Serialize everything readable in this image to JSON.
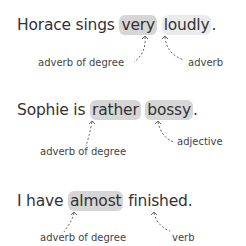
{
  "examples": [
    {
      "sentence": {
        "before": "Horace sings ",
        "highlight1": "very",
        "between": " ",
        "highlight2": "loudly",
        "after": "."
      },
      "labels": {
        "left": "adverb of degree",
        "right": "adverb"
      }
    },
    {
      "sentence": {
        "before": "Sophie is ",
        "highlight1": "rather",
        "between": " ",
        "highlight2": "bossy",
        "after": "."
      },
      "labels": {
        "left": "adverb of degree",
        "right": "adjective"
      }
    },
    {
      "sentence": {
        "before": "I have ",
        "highlight1": "almost",
        "between": " ",
        "highlight2": "finished",
        "after": "."
      },
      "labels": {
        "left": "adverb of degree",
        "right": "verb"
      }
    }
  ],
  "colors": {
    "highlight": "#d6d6d6",
    "highlight_light": "#ebebeb",
    "text": "#333333"
  }
}
